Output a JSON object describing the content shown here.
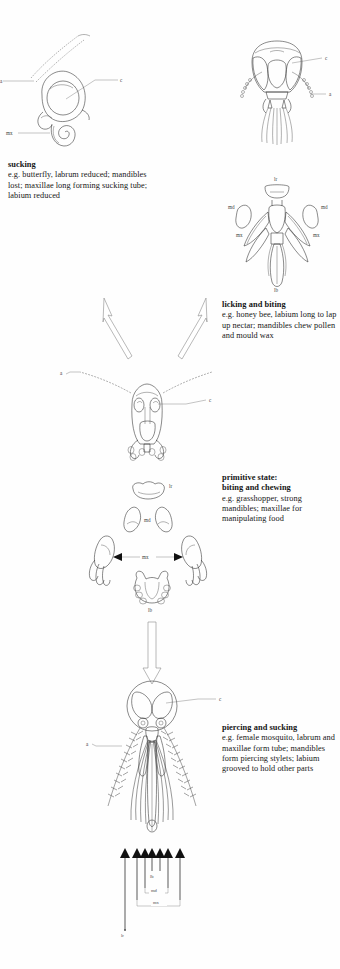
{
  "figure": {
    "background_color": "#fefefe",
    "ink_color": "#2b2b2b"
  },
  "captions": {
    "sucking": {
      "heading": "sucking",
      "body": "e.g. butterfly, labrum reduced; mandibles lost; maxillae long forming sucking tube; labium reduced"
    },
    "licking": {
      "heading": "licking and biting",
      "body": "e.g. honey bee, labium long to lap up nectar; mandibles chew pollen and mould wax"
    },
    "primitive": {
      "heading": "primitive state:",
      "heading2": "biting and chewing",
      "body": "e.g. grasshopper, strong mandibles; maxillae for manipulating food"
    },
    "piercing": {
      "heading": "piercing and sucking",
      "body": "e.g. female mosquito, labrum and maxillae form tube; mandibles form piercing stylets; labium grooved to hold other parts"
    }
  },
  "part_labels": {
    "antenna": "a",
    "compound_eye": "c",
    "labrum": "lr",
    "mandible": "md",
    "maxilla": "mx",
    "labium": "lb"
  },
  "panels": {
    "butterfly": {
      "name": "butterfly head, sucking",
      "labels": [
        "a",
        "c",
        "mx"
      ]
    },
    "bee_head": {
      "name": "honey bee head",
      "labels": [
        "c",
        "a"
      ]
    },
    "bee_parts": {
      "name": "honey bee mouthparts exploded",
      "labels": [
        "lr",
        "md",
        "md",
        "mx",
        "mx",
        "lb"
      ]
    },
    "grasshopper_head": {
      "name": "grasshopper head",
      "labels": [
        "a",
        "c"
      ]
    },
    "grasshopper_parts": {
      "name": "grasshopper mouthparts exploded",
      "labels": [
        "lr",
        "md",
        "mx",
        "lb"
      ]
    },
    "mosquito": {
      "name": "mosquito head, piercing and sucking",
      "labels": [
        "c",
        "a",
        "lb",
        "md",
        "mx",
        "lr"
      ]
    }
  },
  "arrows": {
    "up_left": "evolution arrow to sucking",
    "up_right": "evolution arrow to licking and biting",
    "down": "evolution arrow to piercing and sucking",
    "double_mx": "maxillae pair arrow",
    "stylet_count": 7
  }
}
